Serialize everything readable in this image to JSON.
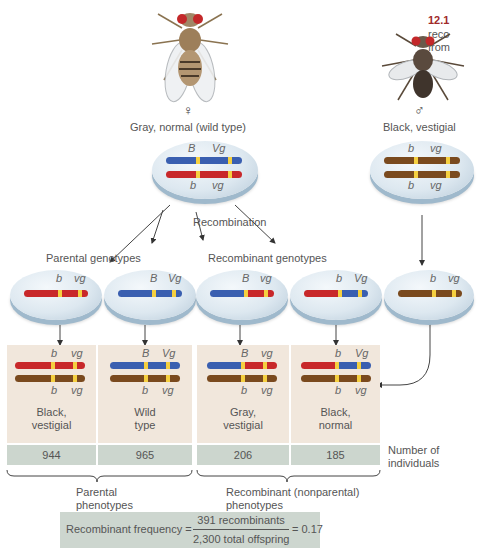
{
  "caption": {
    "number": "12.1",
    "line2": "reco",
    "line3": "from"
  },
  "parents": {
    "female": {
      "symbol": "♀",
      "label": "Gray, normal (wild type)",
      "genes_top": [
        "B",
        "Vg"
      ],
      "genes_bottom": [
        "b",
        "vg"
      ]
    },
    "male": {
      "symbol": "♂",
      "label": "Black, vestigial",
      "genes_top": [
        "b",
        "vg"
      ],
      "genes_bottom": [
        "b",
        "vg"
      ]
    }
  },
  "process": {
    "recombination_label": "Recombination",
    "parental_genotypes_label": "Parental genotypes",
    "recombinant_genotypes_label": "Recombinant genotypes"
  },
  "gametes": [
    {
      "genes": [
        "b",
        "vg"
      ],
      "color": "red"
    },
    {
      "genes": [
        "B",
        "Vg"
      ],
      "color": "blue"
    },
    {
      "genes": [
        "B",
        "vg"
      ],
      "color": "blue-red"
    },
    {
      "genes": [
        "b",
        "Vg"
      ],
      "color": "red-blue"
    },
    {
      "genes": [
        "b",
        "vg"
      ],
      "color": "brown"
    }
  ],
  "offspring": [
    {
      "top_genes": [
        "b",
        "vg"
      ],
      "bottom_genes": [
        "b",
        "vg"
      ],
      "phenotype_line1": "Black,",
      "phenotype_line2": "vestigial",
      "count": "944"
    },
    {
      "top_genes": [
        "B",
        "Vg"
      ],
      "bottom_genes": [
        "b",
        "vg"
      ],
      "phenotype_line1": "Wild",
      "phenotype_line2": "type",
      "count": "965"
    },
    {
      "top_genes": [
        "B",
        "vg"
      ],
      "bottom_genes": [
        "b",
        "vg"
      ],
      "phenotype_line1": "Gray,",
      "phenotype_line2": "vestigial",
      "count": "206"
    },
    {
      "top_genes": [
        "b",
        "Vg"
      ],
      "bottom_genes": [
        "b",
        "vg"
      ],
      "phenotype_line1": "Black,",
      "phenotype_line2": "normal",
      "count": "185"
    }
  ],
  "count_label": {
    "line1": "Number of",
    "line2": "individuals"
  },
  "groups": {
    "parental": {
      "line1": "Parental",
      "line2": "phenotypes"
    },
    "recombinant": {
      "line1": "Recombinant (nonparental)",
      "line2": "phenotypes"
    }
  },
  "formula": {
    "lhs": "Recombinant frequency =",
    "numerator": "391 recombinants",
    "denominator": "2,300 total offspring",
    "result": "= 0.17"
  },
  "colors": {
    "blue_chromosome": "#3a5fb0",
    "red_chromosome": "#c8282a",
    "brown_chromosome": "#7a4a1e",
    "band": "#f5d040",
    "panel_bg": "#f1e7dc",
    "count_bg": "#ccd6ce",
    "caption": "#a02a2a"
  }
}
